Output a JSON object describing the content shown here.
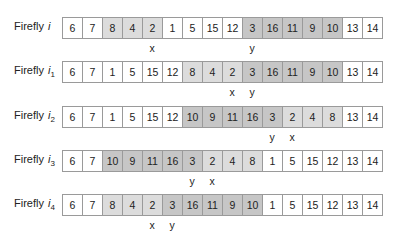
{
  "label_prefix": "Firefly",
  "rows": [
    {
      "symbol": "i",
      "subscript": "",
      "cells": [
        {
          "v": "6",
          "s": "none"
        },
        {
          "v": "7",
          "s": "none"
        },
        {
          "v": "8",
          "s": "light"
        },
        {
          "v": "4",
          "s": "light"
        },
        {
          "v": "2",
          "s": "light"
        },
        {
          "v": "1",
          "s": "none"
        },
        {
          "v": "5",
          "s": "none"
        },
        {
          "v": "15",
          "s": "none"
        },
        {
          "v": "12",
          "s": "none"
        },
        {
          "v": "3",
          "s": "dark"
        },
        {
          "v": "16",
          "s": "dark"
        },
        {
          "v": "11",
          "s": "dark"
        },
        {
          "v": "9",
          "s": "dark"
        },
        {
          "v": "10",
          "s": "dark"
        },
        {
          "v": "13",
          "s": "none"
        },
        {
          "v": "14",
          "s": "none"
        }
      ],
      "markers": [
        {
          "label": "x",
          "cell": 4
        },
        {
          "label": "y",
          "cell": 9
        }
      ]
    },
    {
      "symbol": "i",
      "subscript": "1",
      "cells": [
        {
          "v": "6",
          "s": "none"
        },
        {
          "v": "7",
          "s": "none"
        },
        {
          "v": "1",
          "s": "none"
        },
        {
          "v": "5",
          "s": "none"
        },
        {
          "v": "15",
          "s": "none"
        },
        {
          "v": "12",
          "s": "none"
        },
        {
          "v": "8",
          "s": "light"
        },
        {
          "v": "4",
          "s": "light"
        },
        {
          "v": "2",
          "s": "light"
        },
        {
          "v": "3",
          "s": "dark"
        },
        {
          "v": "16",
          "s": "dark"
        },
        {
          "v": "11",
          "s": "dark"
        },
        {
          "v": "9",
          "s": "dark"
        },
        {
          "v": "10",
          "s": "dark"
        },
        {
          "v": "13",
          "s": "none"
        },
        {
          "v": "14",
          "s": "none"
        }
      ],
      "markers": [
        {
          "label": "x",
          "cell": 8
        },
        {
          "label": "y",
          "cell": 9
        }
      ]
    },
    {
      "symbol": "i",
      "subscript": "2",
      "cells": [
        {
          "v": "6",
          "s": "none"
        },
        {
          "v": "7",
          "s": "none"
        },
        {
          "v": "1",
          "s": "none"
        },
        {
          "v": "5",
          "s": "none"
        },
        {
          "v": "15",
          "s": "none"
        },
        {
          "v": "12",
          "s": "none"
        },
        {
          "v": "10",
          "s": "dark"
        },
        {
          "v": "9",
          "s": "dark"
        },
        {
          "v": "11",
          "s": "dark"
        },
        {
          "v": "16",
          "s": "dark"
        },
        {
          "v": "3",
          "s": "dark"
        },
        {
          "v": "2",
          "s": "light"
        },
        {
          "v": "4",
          "s": "light"
        },
        {
          "v": "8",
          "s": "light"
        },
        {
          "v": "13",
          "s": "none"
        },
        {
          "v": "14",
          "s": "none"
        }
      ],
      "markers": [
        {
          "label": "y",
          "cell": 10
        },
        {
          "label": "x",
          "cell": 11
        }
      ]
    },
    {
      "symbol": "i",
      "subscript": "3",
      "cells": [
        {
          "v": "6",
          "s": "none"
        },
        {
          "v": "7",
          "s": "none"
        },
        {
          "v": "10",
          "s": "dark"
        },
        {
          "v": "9",
          "s": "dark"
        },
        {
          "v": "11",
          "s": "dark"
        },
        {
          "v": "16",
          "s": "dark"
        },
        {
          "v": "3",
          "s": "dark"
        },
        {
          "v": "2",
          "s": "light"
        },
        {
          "v": "4",
          "s": "light"
        },
        {
          "v": "8",
          "s": "light"
        },
        {
          "v": "1",
          "s": "none"
        },
        {
          "v": "5",
          "s": "none"
        },
        {
          "v": "15",
          "s": "none"
        },
        {
          "v": "12",
          "s": "none"
        },
        {
          "v": "13",
          "s": "none"
        },
        {
          "v": "14",
          "s": "none"
        }
      ],
      "markers": [
        {
          "label": "y",
          "cell": 6
        },
        {
          "label": "x",
          "cell": 7
        }
      ]
    },
    {
      "symbol": "i",
      "subscript": "4",
      "cells": [
        {
          "v": "6",
          "s": "none"
        },
        {
          "v": "7",
          "s": "none"
        },
        {
          "v": "8",
          "s": "light"
        },
        {
          "v": "4",
          "s": "light"
        },
        {
          "v": "2",
          "s": "light"
        },
        {
          "v": "3",
          "s": "dark"
        },
        {
          "v": "16",
          "s": "dark"
        },
        {
          "v": "11",
          "s": "dark"
        },
        {
          "v": "9",
          "s": "dark"
        },
        {
          "v": "10",
          "s": "dark"
        },
        {
          "v": "1",
          "s": "none"
        },
        {
          "v": "5",
          "s": "none"
        },
        {
          "v": "15",
          "s": "none"
        },
        {
          "v": "12",
          "s": "none"
        },
        {
          "v": "13",
          "s": "none"
        },
        {
          "v": "14",
          "s": "none"
        }
      ],
      "markers": [
        {
          "label": "x",
          "cell": 4
        },
        {
          "label": "y",
          "cell": 5
        }
      ]
    }
  ],
  "colors": {
    "light": "#dcdcdc",
    "dark": "#c6c6c6",
    "border": "#9a9a9a"
  }
}
